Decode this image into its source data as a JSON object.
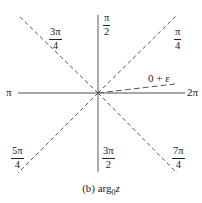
{
  "figure": {
    "caption_prefix": "(b) arg",
    "caption_subscript": "0",
    "caption_variable": "z",
    "axis_labels": {
      "left": "π",
      "right": "2π",
      "top": {
        "num": "π",
        "den": "2"
      },
      "bottom": {
        "num": "3π",
        "den": "2"
      }
    },
    "diagonal_labels": {
      "upper_left": {
        "num": "3π",
        "den": "4"
      },
      "upper_right": {
        "num": "π",
        "den": "4"
      },
      "lower_left": {
        "num": "5π",
        "den": "4"
      },
      "lower_right": {
        "num": "7π",
        "den": "4"
      }
    },
    "branch_label": "0 + ε",
    "colors": {
      "axis": "#8a8a8a",
      "dashed": "#555555",
      "text": "#222222"
    }
  }
}
